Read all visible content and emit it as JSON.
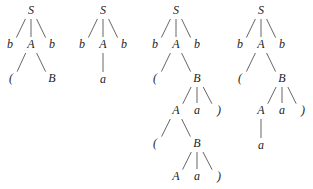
{
  "diagram": {
    "type": "parse-trees",
    "trees": [
      {
        "id": "tree-1",
        "nodes": [
          {
            "id": "t1-S",
            "label": "S",
            "x": 31,
            "y": 14
          },
          {
            "id": "t1-b1",
            "label": "b",
            "x": 10,
            "y": 48
          },
          {
            "id": "t1-A",
            "label": "A",
            "x": 31,
            "y": 48
          },
          {
            "id": "t1-b2",
            "label": "b",
            "x": 52,
            "y": 48
          },
          {
            "id": "t1-lp",
            "label": "(",
            "x": 11,
            "y": 82
          },
          {
            "id": "t1-B",
            "label": "B",
            "x": 52,
            "y": 82
          }
        ],
        "edges": [
          [
            "t1-S",
            "t1-b1"
          ],
          [
            "t1-S",
            "t1-A"
          ],
          [
            "t1-S",
            "t1-b2"
          ],
          [
            "t1-A",
            "t1-lp"
          ],
          [
            "t1-A",
            "t1-B"
          ]
        ]
      },
      {
        "id": "tree-2",
        "nodes": [
          {
            "id": "t2-S",
            "label": "S",
            "x": 103,
            "y": 14
          },
          {
            "id": "t2-b1",
            "label": "b",
            "x": 82,
            "y": 48
          },
          {
            "id": "t2-A",
            "label": "A",
            "x": 103,
            "y": 48
          },
          {
            "id": "t2-b2",
            "label": "b",
            "x": 124,
            "y": 48
          },
          {
            "id": "t2-a",
            "label": "a",
            "x": 103,
            "y": 83
          }
        ],
        "edges": [
          [
            "t2-S",
            "t2-b1"
          ],
          [
            "t2-S",
            "t2-A"
          ],
          [
            "t2-S",
            "t2-b2"
          ],
          [
            "t2-A",
            "t2-a"
          ]
        ]
      },
      {
        "id": "tree-3",
        "nodes": [
          {
            "id": "t3-S",
            "label": "S",
            "x": 176,
            "y": 14
          },
          {
            "id": "t3-b1",
            "label": "b",
            "x": 155,
            "y": 48
          },
          {
            "id": "t3-A",
            "label": "A",
            "x": 176,
            "y": 48
          },
          {
            "id": "t3-b2",
            "label": "b",
            "x": 197,
            "y": 48
          },
          {
            "id": "t3-lp",
            "label": "(",
            "x": 155,
            "y": 82
          },
          {
            "id": "t3-B",
            "label": "B",
            "x": 197,
            "y": 82
          },
          {
            "id": "t3-A2",
            "label": "A",
            "x": 176,
            "y": 114
          },
          {
            "id": "t3-a1",
            "label": "a",
            "x": 197,
            "y": 114
          },
          {
            "id": "t3-rp1",
            "label": ")",
            "x": 219,
            "y": 114
          },
          {
            "id": "t3-lp2",
            "label": "(",
            "x": 155,
            "y": 147
          },
          {
            "id": "t3-B2",
            "label": "B",
            "x": 197,
            "y": 147
          },
          {
            "id": "t3-A3",
            "label": "A",
            "x": 176,
            "y": 180
          },
          {
            "id": "t3-a2",
            "label": "a",
            "x": 197,
            "y": 180
          },
          {
            "id": "t3-rp2",
            "label": ")",
            "x": 219,
            "y": 180
          }
        ],
        "edges": [
          [
            "t3-S",
            "t3-b1"
          ],
          [
            "t3-S",
            "t3-A"
          ],
          [
            "t3-S",
            "t3-b2"
          ],
          [
            "t3-A",
            "t3-lp"
          ],
          [
            "t3-A",
            "t3-B"
          ],
          [
            "t3-B",
            "t3-A2"
          ],
          [
            "t3-B",
            "t3-a1"
          ],
          [
            "t3-B",
            "t3-rp1"
          ],
          [
            "t3-A2",
            "t3-lp2"
          ],
          [
            "t3-A2",
            "t3-B2"
          ],
          [
            "t3-B2",
            "t3-A3"
          ],
          [
            "t3-B2",
            "t3-a2"
          ],
          [
            "t3-B2",
            "t3-rp2"
          ]
        ]
      },
      {
        "id": "tree-4",
        "nodes": [
          {
            "id": "t4-S",
            "label": "S",
            "x": 261,
            "y": 14
          },
          {
            "id": "t4-b1",
            "label": "b",
            "x": 240,
            "y": 48
          },
          {
            "id": "t4-A",
            "label": "A",
            "x": 261,
            "y": 48
          },
          {
            "id": "t4-b2",
            "label": "b",
            "x": 282,
            "y": 48
          },
          {
            "id": "t4-lp",
            "label": "(",
            "x": 240,
            "y": 82
          },
          {
            "id": "t4-B",
            "label": "B",
            "x": 282,
            "y": 82
          },
          {
            "id": "t4-A2",
            "label": "A",
            "x": 261,
            "y": 114
          },
          {
            "id": "t4-a1",
            "label": "a",
            "x": 282,
            "y": 114
          },
          {
            "id": "t4-rp",
            "label": ")",
            "x": 303,
            "y": 114
          },
          {
            "id": "t4-a2",
            "label": "a",
            "x": 261,
            "y": 149
          }
        ],
        "edges": [
          [
            "t4-S",
            "t4-b1"
          ],
          [
            "t4-S",
            "t4-A"
          ],
          [
            "t4-S",
            "t4-b2"
          ],
          [
            "t4-A",
            "t4-lp"
          ],
          [
            "t4-A",
            "t4-B"
          ],
          [
            "t4-B",
            "t4-A2"
          ],
          [
            "t4-B",
            "t4-a1"
          ],
          [
            "t4-B",
            "t4-rp"
          ],
          [
            "t4-A2",
            "t4-a2"
          ]
        ]
      }
    ]
  }
}
